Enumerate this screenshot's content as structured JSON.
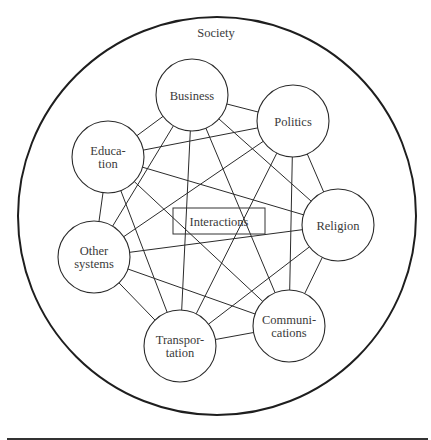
{
  "diagram": {
    "container": {
      "label": "Society",
      "cx": 217,
      "cy": 216,
      "r": 199,
      "label_x": 216,
      "label_y": 37
    },
    "center_box": {
      "label": "Interactions",
      "x": 173,
      "y": 208,
      "width": 92,
      "height": 26
    },
    "node_radius": 36,
    "nodes": [
      {
        "id": "business",
        "lines": [
          "Business"
        ],
        "cx": 192,
        "cy": 95
      },
      {
        "id": "politics",
        "lines": [
          "Politics"
        ],
        "cx": 293,
        "cy": 121
      },
      {
        "id": "education",
        "lines": [
          "Educa-",
          "tion"
        ],
        "cx": 108,
        "cy": 157
      },
      {
        "id": "religion",
        "lines": [
          "Religion"
        ],
        "cx": 338,
        "cy": 225
      },
      {
        "id": "other-systems",
        "lines": [
          "Other",
          "systems"
        ],
        "cx": 94,
        "cy": 257
      },
      {
        "id": "transportation",
        "lines": [
          "Transpor-",
          "tation"
        ],
        "cx": 180,
        "cy": 346
      },
      {
        "id": "communications",
        "lines": [
          "Communi-",
          "cations"
        ],
        "cx": 289,
        "cy": 326
      }
    ],
    "edges": [
      [
        "business",
        "politics"
      ],
      [
        "business",
        "education"
      ],
      [
        "business",
        "religion"
      ],
      [
        "business",
        "other-systems"
      ],
      [
        "business",
        "transportation"
      ],
      [
        "business",
        "communications"
      ],
      [
        "politics",
        "education"
      ],
      [
        "politics",
        "religion"
      ],
      [
        "politics",
        "other-systems"
      ],
      [
        "politics",
        "transportation"
      ],
      [
        "politics",
        "communications"
      ],
      [
        "education",
        "religion"
      ],
      [
        "education",
        "other-systems"
      ],
      [
        "education",
        "transportation"
      ],
      [
        "education",
        "communications"
      ],
      [
        "religion",
        "other-systems"
      ],
      [
        "religion",
        "transportation"
      ],
      [
        "religion",
        "communications"
      ],
      [
        "other-systems",
        "transportation"
      ],
      [
        "other-systems",
        "communications"
      ],
      [
        "transportation",
        "communications"
      ]
    ],
    "rule": {
      "x1": 7,
      "x2": 428,
      "y": 439
    },
    "colors": {
      "stroke": "#2b2b2b",
      "text": "#3a3a3a",
      "background": "#ffffff"
    }
  }
}
